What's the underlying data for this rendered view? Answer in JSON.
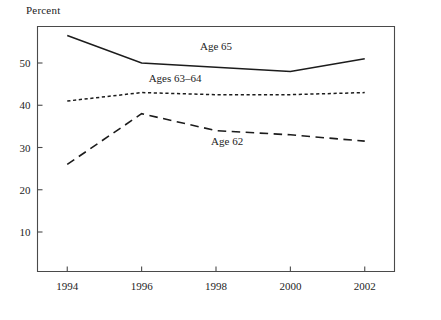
{
  "chart_data": {
    "type": "line",
    "title": "",
    "ylabel": "Percent",
    "xlabel": "",
    "x": [
      1994,
      1995,
      1996,
      1997,
      1998,
      1999,
      2000,
      2001,
      2002
    ],
    "xticks": [
      "1994",
      "1996",
      "1998",
      "2000",
      "2002"
    ],
    "xtick_values": [
      1994,
      1996,
      1998,
      2000,
      2002
    ],
    "yticks": [
      "10",
      "20",
      "30",
      "40",
      "50"
    ],
    "ytick_values": [
      10,
      20,
      30,
      40,
      50
    ],
    "ylim": [
      0,
      60
    ],
    "xlim": [
      1993.2,
      2002.8
    ],
    "grid": false,
    "legend_position": "inline-annotations",
    "series": [
      {
        "name": "Age 65",
        "style": "solid",
        "x": [
          1994,
          1996,
          2000,
          2002
        ],
        "values": [
          56.5,
          50.0,
          48.0,
          51.0
        ],
        "label": "Age 65",
        "label_x": 1998.0,
        "label_y": 53.0
      },
      {
        "name": "Ages 63–64",
        "style": "dotted",
        "x": [
          1994,
          1996,
          1998,
          2000,
          2002
        ],
        "values": [
          41.0,
          43.0,
          42.5,
          42.5,
          43.0
        ],
        "label": "Ages 63–64",
        "label_x": 1996.9,
        "label_y": 45.5
      },
      {
        "name": "Age 62",
        "style": "dashed",
        "x": [
          1994,
          1996,
          1998,
          2000,
          2002
        ],
        "values": [
          26.0,
          38.0,
          34.0,
          33.0,
          31.5
        ],
        "label": "Age 62",
        "label_x": 1998.3,
        "label_y": 30.5
      }
    ]
  },
  "colors": {
    "line": "#1c1c1c",
    "axis": "#4a4a4a",
    "text": "#1d1d1d",
    "background": "#ffffff"
  }
}
